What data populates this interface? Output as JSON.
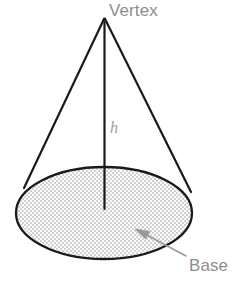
{
  "figure": {
    "type": "geometry-diagram",
    "shape": "cone",
    "background_color": "#ffffff",
    "width": 234,
    "height": 289
  },
  "labels": {
    "vertex": "Vertex",
    "height": "h",
    "base": "Base"
  },
  "colors": {
    "outline": "#1a1a1a",
    "label_text": "#8d8d8d",
    "height_text": "#a0a0a0",
    "arrow": "#9a9a9a",
    "stipple": "#c9c9c9",
    "fill": "#fafafa"
  },
  "geometry": {
    "apex": {
      "x": 104,
      "y": 18
    },
    "base_center": {
      "x": 104,
      "y": 213
    },
    "base_rx": 89,
    "base_ry": 47,
    "left_slant_end": {
      "x": 24,
      "y": 188
    },
    "right_slant_end": {
      "x": 191,
      "y": 192
    },
    "height_line_end": {
      "x": 104,
      "y": 209
    },
    "base_arrow_tail": {
      "x": 186,
      "y": 255
    },
    "base_arrow_tip": {
      "x": 136,
      "y": 230
    }
  }
}
